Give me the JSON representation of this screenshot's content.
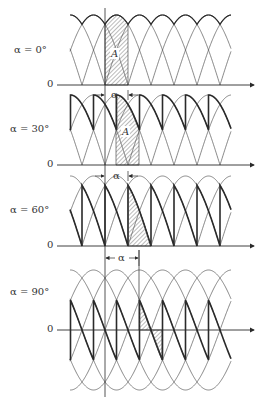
{
  "figure": {
    "colors": {
      "line": "#2a2a2a",
      "thin": "#555555",
      "hatch": "#555555",
      "background": "#ffffff"
    },
    "vertical_reference_x": 105,
    "vertical_reference_y": [
      8,
      397
    ],
    "deg_per_px": 2.6087,
    "curve_x_start": 70,
    "curve_x_end": 231,
    "first_pulse_start_x": 36,
    "pulse_spacing_px": 23,
    "axis_x_start": 57,
    "axis_x_end": 254,
    "panels": [
      {
        "id": "alpha-0",
        "label": "α = 0°",
        "label_x": 14,
        "label_y": 50,
        "zero_label": "0",
        "axis_y": 85,
        "amplitude_px": 70,
        "alpha_deg": 0,
        "full_wave": false,
        "area_label": "A",
        "area_label_x": 110,
        "area_label_y": 55,
        "hatch_from_x": 105,
        "hatch_to_x": 128,
        "alpha_marker": {
          "label": "α",
          "y": 95,
          "from_x": 105,
          "to_x": 128,
          "style": "inward"
        }
      },
      {
        "id": "alpha-30",
        "label": "α = 30°",
        "label_x": 10,
        "label_y": 128,
        "zero_label": "0",
        "axis_y": 165,
        "amplitude_px": 70,
        "alpha_deg": 30,
        "full_wave": false,
        "area_label": "A",
        "area_label_x": 121,
        "area_label_y": 132,
        "hatch_from_x": 116,
        "hatch_to_x": 139,
        "alpha_marker": {
          "label": "α",
          "y": 176,
          "from_x": 105,
          "to_x": 128,
          "style": "inward"
        }
      },
      {
        "id": "alpha-60",
        "label": "α = 60°",
        "label_x": 10,
        "label_y": 209,
        "zero_label": "0",
        "axis_y": 246,
        "amplitude_px": 70,
        "alpha_deg": 60,
        "full_wave": false,
        "area_label": "",
        "hatch_from_x": 128,
        "hatch_to_x": 151,
        "alpha_marker": {
          "label": "α",
          "y": 258,
          "from_x": 105,
          "to_x": 139,
          "style": "outward"
        }
      },
      {
        "id": "alpha-90",
        "label": "α = 90°",
        "label_x": 10,
        "label_y": 292,
        "zero_label": "0",
        "axis_y": 330,
        "amplitude_px": 60,
        "alpha_deg": 90,
        "full_wave": true,
        "area_label": "",
        "hatch_from_x": 139,
        "hatch_to_x": 162,
        "alpha_marker_line": {
          "x": 139,
          "y1": 250,
          "y2": 300
        }
      }
    ]
  }
}
